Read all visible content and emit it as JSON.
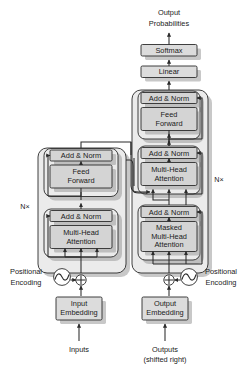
{
  "figure": {
    "top_output_line1": "Output",
    "top_output_line2": "Probabilities",
    "softmax": "Softmax",
    "linear": "Linear",
    "add_norm": "Add & Norm",
    "feed_line1": "Feed",
    "feed_line2": "Forward",
    "mha_line1": "Multi-Head",
    "mha_line2": "Attention",
    "masked_line1": "Masked",
    "masked_line2": "Multi-Head",
    "masked_line3": "Attention",
    "input_embedding_line1": "Input",
    "input_embedding_line2": "Embedding",
    "output_embedding_line1": "Output",
    "output_embedding_line2": "Embedding",
    "positional_line1": "Positional",
    "positional_line2": "Encoding",
    "inputs": "Inputs",
    "outputs_line1": "Outputs",
    "outputs_line2": "(shifted right)",
    "nx_left": "N×",
    "nx_right": "N×"
  },
  "colors": {
    "box_fill": "#d4d4d4",
    "outer_fill": "#ebebeb",
    "stroke": "#2b2b2b",
    "background": "#ffffff",
    "shadow": "#9a9a9a"
  },
  "icons": {
    "plus_circle": "circled-plus-icon",
    "sine_wave": "sine-wave-icon",
    "arrow": "arrow-head-icon"
  }
}
